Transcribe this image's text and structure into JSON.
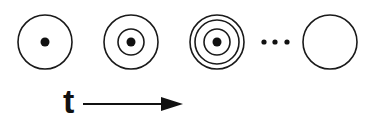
{
  "diagram": {
    "stroke_color": "#1a1a1a",
    "stages": [
      {
        "cx": 45,
        "cy": 42,
        "rings": [
          27
        ],
        "center_dot": true
      },
      {
        "cx": 131,
        "cy": 42,
        "rings": [
          27,
          13
        ],
        "center_dot": true
      },
      {
        "cx": 217,
        "cy": 42,
        "rings": [
          27,
          22,
          13
        ],
        "center_dot": true
      },
      {
        "cx": 330,
        "cy": 42,
        "rings": [
          27
        ],
        "center_dot": false
      }
    ],
    "ellipsis_dots": [
      264,
      275,
      287
    ],
    "time_label": "t",
    "arrow": {
      "x1": 83,
      "x2": 182,
      "y": 104
    }
  }
}
